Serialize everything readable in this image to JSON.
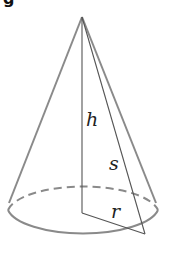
{
  "figure": {
    "type": "right circular cone",
    "cropped_heading_fragment": "g",
    "labels": {
      "height": "h",
      "slant_height": "s",
      "radius": "r"
    },
    "colors": {
      "outline": "#8a8a8a",
      "inner_lines": "#555555",
      "label_text": "#222222",
      "background": "#ffffff"
    }
  }
}
